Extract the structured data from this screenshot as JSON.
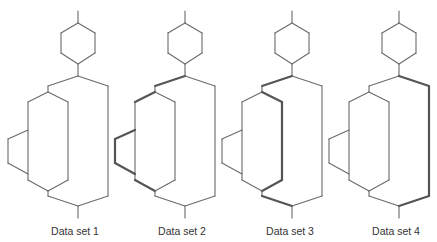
{
  "diagrams": [
    {
      "label": "Data set 1",
      "x": 78,
      "thick": []
    },
    {
      "label": "Data set 2",
      "x": 185,
      "thick": [
        "branch-left",
        "inner-top-left",
        "tri-top",
        "tri-left",
        "tri-bottom",
        "inner-bottom-left"
      ]
    },
    {
      "label": "Data set 3",
      "x": 292,
      "thick": [
        "branch-left",
        "inner-top-right",
        "inner-right",
        "inner-bottom-right",
        "join-left"
      ]
    },
    {
      "label": "Data set 4",
      "x": 399,
      "thick": [
        "branch-right",
        "outer-right",
        "join-right"
      ]
    }
  ],
  "colors": {
    "stroke": "#6a6a6a",
    "thick_stroke": "#555555",
    "background": "#ffffff"
  }
}
